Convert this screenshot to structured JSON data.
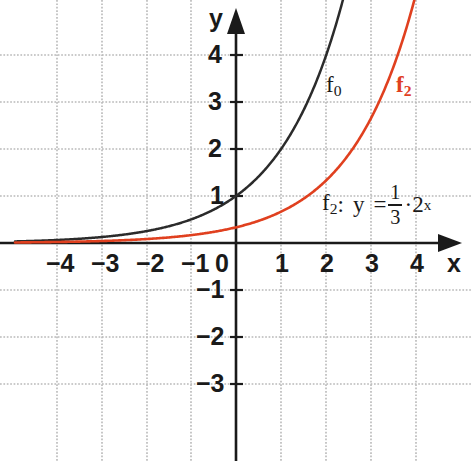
{
  "chart_data": {
    "type": "line",
    "title": "",
    "xlabel": "x",
    "ylabel": "y",
    "xlim": [
      -4.9,
      4.95
    ],
    "ylim": [
      -3.7,
      4.55
    ],
    "grid": true,
    "grid_spacing": 1,
    "legend": "inline-labels",
    "x_ticks": [
      "−4",
      "−3",
      "−2",
      "−1",
      "0",
      "1",
      "2",
      "3",
      "4"
    ],
    "x_tick_values": [
      -4,
      -3,
      -2,
      -1,
      0,
      1,
      2,
      3,
      4
    ],
    "y_ticks": [
      "4",
      "3",
      "2",
      "1",
      "−1",
      "−2",
      "−3"
    ],
    "y_tick_values": [
      4,
      3,
      2,
      1,
      -1,
      -2,
      -3
    ],
    "series": [
      {
        "name": "f0",
        "label": "f",
        "label_sub": "0",
        "color": "#2b2b2b",
        "expression": "y = 2^x",
        "base": 2,
        "coefficient": 1,
        "x": [
          -4.9,
          -4,
          -3,
          -2,
          -1,
          0,
          1,
          1.585,
          2,
          2.2
        ],
        "values": [
          0.033,
          0.0625,
          0.125,
          0.25,
          0.5,
          1,
          2,
          3,
          4,
          4.59
        ]
      },
      {
        "name": "f2",
        "label": "f",
        "label_sub": "2",
        "color": "#e0401f",
        "expression": "y = (1/3)·2^x",
        "base": 2,
        "coefficient": 0.3333333,
        "x": [
          -4.9,
          -4,
          -3,
          -2,
          -1,
          0,
          1,
          2,
          3,
          3.585,
          3.78
        ],
        "values": [
          0.011,
          0.0208,
          0.0417,
          0.0833,
          0.167,
          0.333,
          0.667,
          1.333,
          2.667,
          4,
          4.58
        ]
      }
    ],
    "annotations": [
      {
        "name": "formula-f2",
        "text": "f₂:  y = 1/3 · 2ˣ",
        "x": 1.9,
        "y": 0.75
      }
    ]
  },
  "axes": {
    "x_axis_label": "x",
    "y_axis_label": "y"
  },
  "ticks": {
    "x": [
      {
        "label": "−4",
        "value": -4
      },
      {
        "label": "−3",
        "value": -3
      },
      {
        "label": "−2",
        "value": -2
      },
      {
        "label": "−1",
        "value": -1
      },
      {
        "label": "0",
        "value": 0
      },
      {
        "label": "1",
        "value": 1
      },
      {
        "label": "2",
        "value": 2
      },
      {
        "label": "3",
        "value": 3
      },
      {
        "label": "4",
        "value": 4
      }
    ],
    "y": [
      {
        "label": "4",
        "value": 4
      },
      {
        "label": "3",
        "value": 3
      },
      {
        "label": "2",
        "value": 2
      },
      {
        "label": "1",
        "value": 1
      },
      {
        "label": "−1",
        "value": -1
      },
      {
        "label": "−2",
        "value": -2
      },
      {
        "label": "−3",
        "value": -3
      }
    ]
  },
  "curve_labels": {
    "f0": {
      "base": "f",
      "sub": "0"
    },
    "f2": {
      "base": "f",
      "sub": "2"
    }
  },
  "formula": {
    "name_base": "f",
    "name_sub": "2",
    "colon": ":",
    "variable": "y",
    "equals": "=",
    "numerator": "1",
    "denominator": "3",
    "dot": "·",
    "base": "2",
    "exponent": "x"
  },
  "colors": {
    "f0": "#2b2b2b",
    "f2": "#e0401f",
    "axis": "#1a1a1a",
    "grid": "#b9b9b9",
    "background": "#ffffff"
  }
}
